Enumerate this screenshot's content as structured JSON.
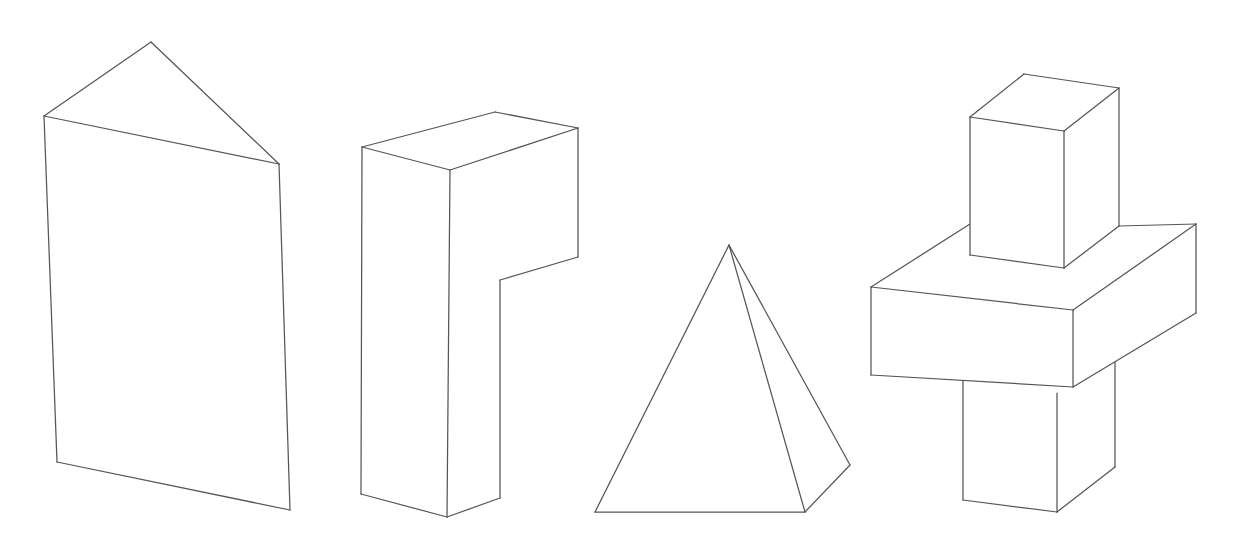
{
  "canvas": {
    "width": 1240,
    "height": 551,
    "background_color": "#ffffff",
    "stroke_color": "#55555c",
    "stroke_width": 1.25,
    "fill_color": "#ffffff",
    "title": "Line drawing of four geometric solids"
  },
  "figure": {
    "type": "line-drawing",
    "style": "hidden-line-removed wireframe / technical sketch",
    "shape_count": 4,
    "shapes": [
      {
        "id": "shape-1",
        "name": "pentagonal-prism",
        "label": "Pentagonal prism (house-shaped prism, gable end)",
        "position": "left",
        "faces": [
          {
            "name": "front-face",
            "points": "44,116 279,164 290,510 57,462"
          },
          {
            "name": "gable-roof-face",
            "points": "44,116 151,42 279,164"
          }
        ],
        "edges": [
          {
            "name": "apex-to-left-eave",
            "points": "151,42 44,116"
          },
          {
            "name": "apex-to-right-eave",
            "points": "151,42 279,164"
          },
          {
            "name": "eave-ridge-line",
            "points": "44,116 279,164"
          },
          {
            "name": "left-vertical-edge",
            "points": "44,116 57,462"
          },
          {
            "name": "right-vertical-edge",
            "points": "279,164 290,510"
          },
          {
            "name": "bottom-edge",
            "points": "57,462 290,510"
          }
        ],
        "vertices": [
          {
            "name": "apex",
            "x": 151,
            "y": 42
          },
          {
            "name": "left-eave",
            "x": 44,
            "y": 116
          },
          {
            "name": "right-eave",
            "x": 279,
            "y": 164
          },
          {
            "name": "bottom-left",
            "x": 57,
            "y": 462
          },
          {
            "name": "bottom-right",
            "x": 290,
            "y": 510
          }
        ]
      },
      {
        "id": "shape-2",
        "name": "l-shaped-block",
        "label": "L-shaped block (stepped rectangular solid)",
        "position": "center-left",
        "faces": [
          {
            "name": "top-face",
            "points": "362,147 495,112 578,128 450,170"
          },
          {
            "name": "left-front-face",
            "points": "362,147 450,170 447,517 361,494"
          },
          {
            "name": "right-side-face",
            "points": "450,170 578,128 578,257 500,280 500,498 447,517"
          }
        ],
        "edges": [
          {
            "name": "top-back-left-edge",
            "points": "362,147 495,112"
          },
          {
            "name": "top-back-right-edge",
            "points": "495,112 578,128"
          },
          {
            "name": "top-front-right-edge",
            "points": "578,128 450,170"
          },
          {
            "name": "top-front-left-edge",
            "points": "450,170 362,147"
          },
          {
            "name": "front-left-vertical",
            "points": "362,147 361,494"
          },
          {
            "name": "front-center-vertical",
            "points": "450,170 447,517"
          },
          {
            "name": "right-outer-vertical",
            "points": "578,128 578,257"
          },
          {
            "name": "notch-diagonal",
            "points": "578,257 500,280"
          },
          {
            "name": "notch-inner-vertical",
            "points": "500,280 500,498"
          },
          {
            "name": "bottom-left-edge",
            "points": "361,494 447,517"
          },
          {
            "name": "bottom-right-edge",
            "points": "447,517 500,498"
          }
        ]
      },
      {
        "id": "shape-3",
        "name": "square-pyramid",
        "label": "Square-based pyramid",
        "position": "center-right",
        "faces": [
          {
            "name": "front-left-face",
            "points": "729,245 595,512 805,512"
          },
          {
            "name": "right-face",
            "points": "729,245 805,512 850,465"
          }
        ],
        "edges": [
          {
            "name": "apex-to-front-left-base",
            "points": "729,245 595,512"
          },
          {
            "name": "apex-to-front-base",
            "points": "729,245 805,512"
          },
          {
            "name": "apex-to-right-base",
            "points": "729,245 850,465"
          },
          {
            "name": "base-front-edge",
            "points": "595,512 805,512"
          },
          {
            "name": "base-right-edge",
            "points": "805,512 850,465"
          }
        ],
        "vertices": [
          {
            "name": "apex",
            "x": 729,
            "y": 245
          },
          {
            "name": "base-left",
            "x": 595,
            "y": 512
          },
          {
            "name": "base-front",
            "x": 805,
            "y": 512
          },
          {
            "name": "base-right",
            "x": 850,
            "y": 465
          }
        ]
      },
      {
        "id": "shape-4",
        "name": "stacked-boxes",
        "label": "Three stacked rectangular boxes (tall box on slab on column)",
        "position": "right",
        "parts": [
          {
            "name": "top-box",
            "label": "Upper vertical box",
            "faces": [
              {
                "name": "top-face",
                "points": "970,117 1024,74 1119,88 1064,131"
              },
              {
                "name": "front-left-face",
                "points": "970,117 1064,131 1064,268 970,255"
              },
              {
                "name": "right-face",
                "points": "1064,131 1119,88 1119,226 1064,268"
              }
            ],
            "edges": [
              {
                "name": "top-back-left-edge",
                "points": "970,117 1024,74"
              },
              {
                "name": "top-back-right-edge",
                "points": "1024,74 1119,88"
              },
              {
                "name": "top-front-right-edge",
                "points": "1119,88 1064,131"
              },
              {
                "name": "top-front-left-edge",
                "points": "1064,131 970,117"
              },
              {
                "name": "left-vertical-edge",
                "points": "970,117 970,255"
              },
              {
                "name": "front-center-vertical-edge",
                "points": "1064,131 1064,268"
              },
              {
                "name": "right-vertical-edge",
                "points": "1119,88 1119,226"
              },
              {
                "name": "bottom-left-edge",
                "points": "970,255 1064,268"
              },
              {
                "name": "bottom-right-edge",
                "points": "1064,268 1119,226"
              }
            ]
          },
          {
            "name": "middle-slab",
            "label": "Horizontal slab / platform",
            "faces": [
              {
                "name": "top-face",
                "points": "871,287 970,224 1196,224 1073,310"
              },
              {
                "name": "front-left-face",
                "points": "871,287 1073,310 1073,387 871,375"
              },
              {
                "name": "right-face",
                "points": "1073,310 1196,224 1196,313 1073,387"
              }
            ],
            "edges": [
              {
                "name": "top-back-left-edge",
                "points": "871,287 970,224"
              },
              {
                "name": "top-back-right-edge",
                "points": "1119,226 1196,224"
              },
              {
                "name": "top-front-right-edge",
                "points": "1196,224 1073,310"
              },
              {
                "name": "top-front-left-edge",
                "points": "1073,310 871,287"
              },
              {
                "name": "left-vertical-edge",
                "points": "871,287 871,375"
              },
              {
                "name": "front-center-vertical-edge",
                "points": "1073,310 1073,387"
              },
              {
                "name": "right-vertical-edge",
                "points": "1196,224 1196,313"
              },
              {
                "name": "bottom-left-edge",
                "points": "871,375 1073,387"
              },
              {
                "name": "bottom-right-edge",
                "points": "1073,387 1196,313"
              }
            ]
          },
          {
            "name": "bottom-column",
            "label": "Lower supporting box / column",
            "faces": [
              {
                "name": "front-left-face",
                "points": "963,381 1057,393 1057,512 963,500"
              },
              {
                "name": "right-face",
                "points": "1057,393 1115,348 1115,467 1057,512"
              }
            ],
            "edges": [
              {
                "name": "left-vertical-edge",
                "points": "963,381 963,500"
              },
              {
                "name": "front-center-vertical-edge",
                "points": "1057,393 1057,512"
              },
              {
                "name": "right-vertical-edge",
                "points": "1115,348 1115,467"
              },
              {
                "name": "bottom-left-edge",
                "points": "963,500 1057,512"
              },
              {
                "name": "bottom-right-edge",
                "points": "1057,512 1115,467"
              }
            ]
          }
        ]
      }
    ]
  }
}
